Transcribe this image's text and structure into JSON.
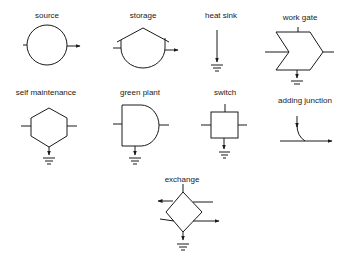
{
  "diagram": {
    "colors": {
      "stroke": "#1a1a1a",
      "background": "#ffffff"
    },
    "symbols": [
      {
        "id": "source",
        "label": "source",
        "shape": "circle",
        "label_pos": [
          47,
          12
        ]
      },
      {
        "id": "storage",
        "label": "storage",
        "shape": "tank-with-roof",
        "label_pos": [
          143,
          12
        ]
      },
      {
        "id": "heat-sink",
        "label": "heat sink",
        "shape": "arrow-to-ground",
        "label_pos": [
          221,
          12
        ]
      },
      {
        "id": "work-gate",
        "label": "work gate",
        "shape": "chevron",
        "label_pos": [
          300,
          14
        ]
      },
      {
        "id": "self-maintenance",
        "label": "self maintenance",
        "shape": "hexagon",
        "label_pos": [
          46,
          90
        ]
      },
      {
        "id": "green-plant",
        "label": "green plant",
        "shape": "bullet",
        "label_pos": [
          140,
          90
        ]
      },
      {
        "id": "switch",
        "label": "switch",
        "shape": "square",
        "label_pos": [
          225,
          90
        ]
      },
      {
        "id": "adding-junction",
        "label": "adding junction",
        "shape": "merging-arrows",
        "label_pos": [
          305,
          97
        ]
      },
      {
        "id": "exchange",
        "label": "exchange",
        "shape": "diamond",
        "label_pos": [
          182,
          176
        ]
      }
    ]
  }
}
